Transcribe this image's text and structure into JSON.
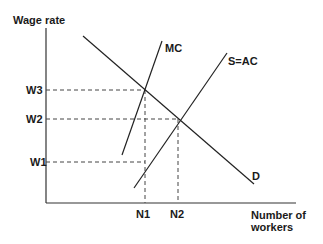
{
  "diagram": {
    "type": "monopsony-labour-market",
    "y_axis_label": "Wage rate",
    "x_axis_label_line1": "Number of",
    "x_axis_label_line2": "workers",
    "curves": {
      "mc": "MC",
      "supply": "S=AC",
      "demand": "D"
    },
    "wage_ticks": [
      "W3",
      "W2",
      "W1"
    ],
    "quantity_ticks": [
      "N1",
      "N2"
    ]
  },
  "colors": {
    "line": "#222222",
    "background": "#ffffff"
  }
}
